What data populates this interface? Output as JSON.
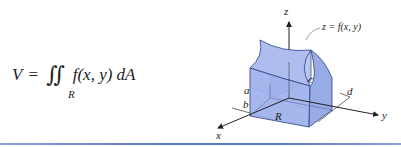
{
  "formula": {
    "lhs": "V",
    "equals": "=",
    "integral": "∬",
    "region_subscript": "R",
    "integrand": "f(x, y) dA"
  },
  "diagram": {
    "axis_labels": {
      "x": "x",
      "y": "y",
      "z": "z"
    },
    "surface_label": "z = f(x, y)",
    "region_label": "R",
    "bounds": {
      "a": "a",
      "b": "b",
      "c": "c",
      "d": "d"
    },
    "colors": {
      "solid_fill": "#9db1ea",
      "solid_stroke": "#3d4f8f",
      "axis": "#222222",
      "rule": "#5a78c8"
    }
  }
}
